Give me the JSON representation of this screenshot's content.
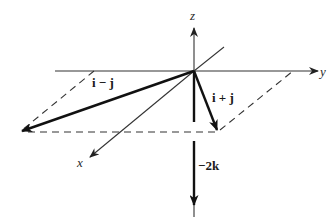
{
  "diagram": {
    "title": "",
    "axes": {
      "x_label": "x",
      "y_label": "y",
      "z_label": "z"
    },
    "vectors": [
      {
        "id": "i_minus_j",
        "label": "i − j"
      },
      {
        "id": "i_plus_j",
        "label": "i + j"
      },
      {
        "id": "minus_2k",
        "label": "−2k"
      }
    ],
    "colors": {
      "line": "#333333",
      "vector": "#111111",
      "background": "#ffffff"
    }
  }
}
